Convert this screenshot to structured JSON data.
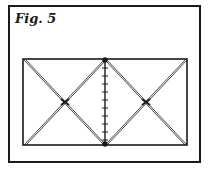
{
  "figure": {
    "caption": "Fig. 5"
  },
  "colors": {
    "ink": "#1a1a1a",
    "background": "#ffffff"
  }
}
